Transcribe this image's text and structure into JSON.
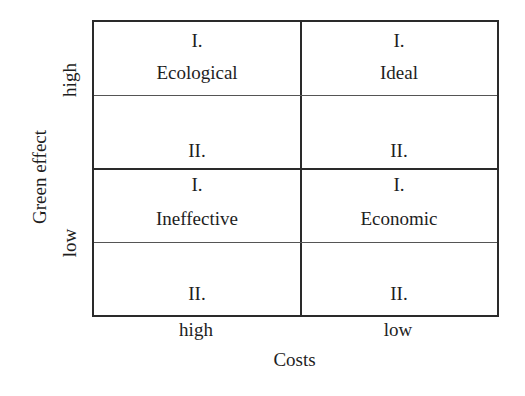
{
  "diagram": {
    "type": "2x2 matrix",
    "x_axis": {
      "title": "Costs",
      "ticks": [
        "high",
        "low"
      ]
    },
    "y_axis": {
      "title": "Green effect",
      "ticks": [
        "high",
        "low"
      ]
    },
    "quadrants": {
      "top_left": {
        "label": "Ecological",
        "sub_top": "I.",
        "sub_bottom": "II."
      },
      "top_right": {
        "label": "Ideal",
        "sub_top": "I.",
        "sub_bottom": "II."
      },
      "bottom_left": {
        "label": "Ineffective",
        "sub_top": "I.",
        "sub_bottom": "II."
      },
      "bottom_right": {
        "label": "Economic",
        "sub_top": "I.",
        "sub_bottom": "II."
      }
    },
    "colors": {
      "line": "#2a2a2a",
      "text": "#1e1e1e",
      "background": "#ffffff"
    }
  }
}
